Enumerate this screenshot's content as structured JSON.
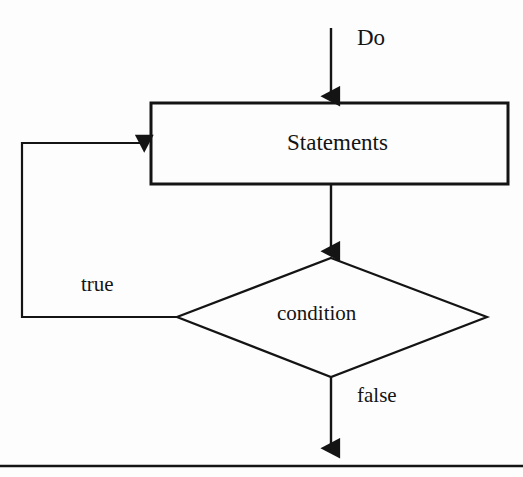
{
  "diagram": {
    "type": "flowchart",
    "background_color": "#fdfdfd",
    "stroke_color": "#141414",
    "entry_label": "Do",
    "process": {
      "shape": "rectangle",
      "label": "Statements"
    },
    "decision": {
      "shape": "diamond",
      "label": "condition"
    },
    "branches": {
      "true_label": "true",
      "false_label": "false"
    },
    "footer_rule": true
  }
}
